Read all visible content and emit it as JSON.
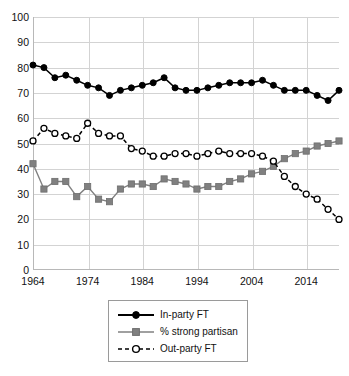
{
  "chart_data": {
    "type": "line",
    "title": "",
    "subtitle": "",
    "xlabel": "",
    "ylabel": "",
    "xlim": [
      1964,
      2020
    ],
    "ylim": [
      0,
      100
    ],
    "grid": true,
    "legend_position": "bottom-center",
    "x_tick_labels": [
      "1964",
      "1974",
      "1984",
      "1994",
      "2004",
      "2014"
    ],
    "x_ticks": [
      1964,
      1974,
      1984,
      1994,
      2004,
      2014
    ],
    "y_tick_labels": [
      "0",
      "10",
      "20",
      "30",
      "40",
      "50",
      "60",
      "70",
      "80",
      "90",
      "100"
    ],
    "y_ticks": [
      0,
      10,
      20,
      30,
      40,
      50,
      60,
      70,
      80,
      90,
      100
    ],
    "x": [
      1964,
      1966,
      1968,
      1970,
      1972,
      1974,
      1976,
      1978,
      1980,
      1982,
      1984,
      1986,
      1988,
      1990,
      1992,
      1994,
      1996,
      1998,
      2000,
      2002,
      2004,
      2006,
      2008,
      2010,
      2012,
      2014,
      2016,
      2018,
      2020
    ],
    "series": [
      {
        "name": "In-party FT",
        "color": "#000000",
        "marker": "filled-circle",
        "line_style": "solid",
        "values": [
          81,
          80,
          76,
          77,
          75,
          73,
          72,
          69,
          71,
          72,
          73,
          74,
          76,
          72,
          71,
          71,
          72,
          73,
          74,
          74,
          74,
          75,
          73,
          71,
          71,
          71,
          69,
          67,
          71
        ]
      },
      {
        "name": "% strong partisan",
        "color": "#808080",
        "marker": "filled-square",
        "line_style": "solid",
        "values": [
          42,
          32,
          35,
          35,
          29,
          33,
          28,
          27,
          32,
          34,
          34,
          33,
          36,
          35,
          34,
          32,
          33,
          33,
          35,
          36,
          38,
          39,
          41,
          44,
          46,
          47,
          49,
          50,
          51
        ]
      },
      {
        "name": "Out-party FT",
        "color": "#000000",
        "marker": "open-circle",
        "line_style": "dashed",
        "values": [
          51,
          56,
          54,
          53,
          52,
          58,
          54,
          53,
          53,
          48,
          47,
          45,
          45,
          46,
          46,
          45,
          46,
          47,
          46,
          46,
          46,
          45,
          43,
          37,
          33,
          30,
          28,
          24,
          20
        ]
      }
    ]
  },
  "legend": {
    "items": [
      {
        "label": "In-party FT"
      },
      {
        "label": "% strong partisan"
      },
      {
        "label": "Out-party FT"
      }
    ]
  }
}
